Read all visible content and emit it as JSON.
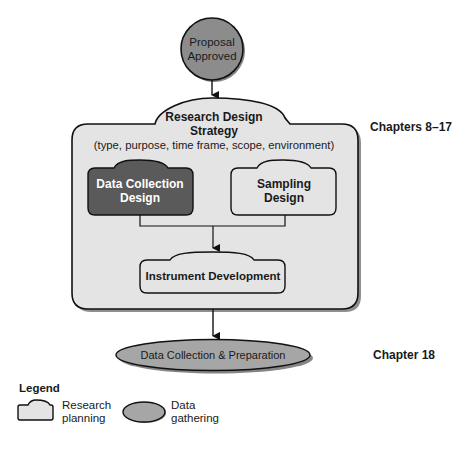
{
  "diagram": {
    "start_node": {
      "label_line1": "Proposal",
      "label_line2": "Approved",
      "shape": "circle",
      "fill": "#8c8c8c"
    },
    "strategy": {
      "title_line1": "Research Design",
      "title_line2": "Strategy",
      "subtitle": "(type, purpose, time frame, scope, environment)",
      "fill": "#e4e4e4",
      "chapters": "Chapters 8–17"
    },
    "data_collection_design": {
      "label_line1": "Data Collection",
      "label_line2": "Design",
      "fill": "#5a5a5a"
    },
    "sampling_design": {
      "label_line1": "Sampling",
      "label_line2": "Design",
      "fill": "#e4e4e4"
    },
    "instrument_development": {
      "label": "Instrument Development",
      "fill": "#e4e4e4"
    },
    "data_collection_prep": {
      "label": "Data Collection & Preparation",
      "fill": "#a6a6a6",
      "chapters": "Chapter 18"
    }
  },
  "legend": {
    "title": "Legend",
    "items": [
      {
        "shape": "research-planning-shape",
        "line1": "Research",
        "line2": "planning"
      },
      {
        "shape": "data-gathering-ellipse",
        "line1": "Data",
        "line2": "gathering"
      }
    ]
  }
}
